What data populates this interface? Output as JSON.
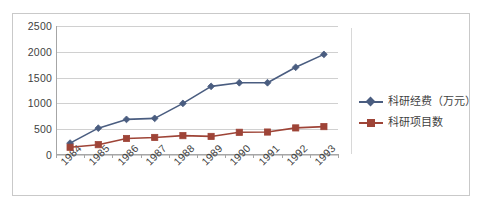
{
  "chart_data": {
    "type": "line",
    "title": "",
    "xlabel": "",
    "ylabel": "",
    "categories": [
      "1984",
      "1985",
      "1986",
      "1987",
      "1988",
      "1989",
      "1990",
      "1991",
      "1992",
      "1993"
    ],
    "series": [
      {
        "name": "科研经费（万元）",
        "color": "#4a5d80",
        "marker": "diamond",
        "values": [
          230,
          520,
          690,
          710,
          1000,
          1330,
          1400,
          1400,
          1700,
          1950
        ]
      },
      {
        "name": "科研项目数",
        "color": "#9e4437",
        "marker": "square",
        "values": [
          150,
          200,
          320,
          340,
          375,
          360,
          440,
          445,
          525,
          550
        ]
      }
    ],
    "ylim": [
      0,
      2500
    ],
    "yticks": [
      0,
      500,
      1000,
      1500,
      2000,
      2500
    ],
    "ytick_labels": [
      "0",
      "500",
      "1000",
      "1500",
      "2000",
      "2500"
    ],
    "grid": "horizontal",
    "legend_position": "right",
    "xtick_rotation": -45,
    "plot_background": "#ffffff",
    "gridline_color": "#d0d0d0",
    "axis_color": "#a6a6a6",
    "border_color": "#c9c9c9"
  },
  "legend": {
    "entries": [
      {
        "label": "科研经费（万元）"
      },
      {
        "label": "科研项目数"
      }
    ]
  }
}
